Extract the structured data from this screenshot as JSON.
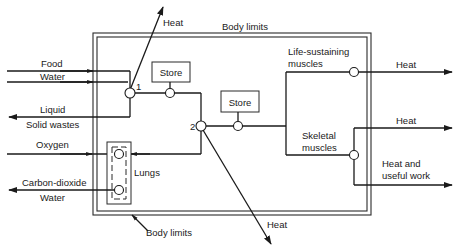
{
  "diagram": {
    "type": "energy-flow block diagram",
    "boundary": {
      "top_label": "Body limits",
      "bottom_label": "Body limits"
    },
    "inputs": {
      "food": "Food",
      "water": "Water",
      "oxygen": "Oxygen"
    },
    "outputs": {
      "liquid": "Liquid",
      "solid_wastes": "Solid wastes",
      "carbon_dioxide": "Carbon-dioxide",
      "water_out": "Water",
      "heat_top": "Heat",
      "heat_bottom": "Heat",
      "heat_life": "Heat",
      "heat_skeletal": "Heat",
      "heat_work_line1": "Heat and",
      "heat_work_line2": "useful work"
    },
    "nodes": {
      "node1": "1",
      "node2": "2"
    },
    "stores": {
      "store1": "Store",
      "store2": "Store"
    },
    "organs": {
      "lungs": "Lungs",
      "life_line1": "Life-sustaining",
      "life_line2": "muscles",
      "skeletal_line1": "Skeletal",
      "skeletal_line2": "muscles"
    }
  }
}
